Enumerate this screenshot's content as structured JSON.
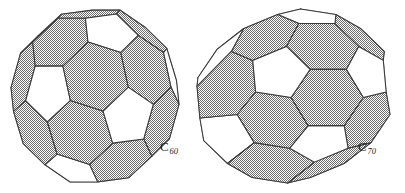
{
  "figure": {
    "name": "fullerene-structures",
    "background_color": "#ffffff",
    "line_color": "#3a3a3a",
    "shaded_face_color": "#b9b9b9",
    "white_face_color": "#ffffff",
    "caption_color": "#1a1a1a"
  },
  "molecules": [
    {
      "id": "c60",
      "element": "C",
      "atom_count": "60",
      "label_text": "C",
      "label_subscript": "60",
      "shape": "truncated-icosahedron",
      "pentagon_count": 12,
      "hexagon_count": 20,
      "vertex_count": 60,
      "edge_count": 90,
      "pentagon_fill": "white",
      "hexagon_fill": "shaded",
      "center_x": 95,
      "center_y": 96,
      "radius_x": 84,
      "radius_y": 86
    },
    {
      "id": "c70",
      "element": "C",
      "atom_count": "70",
      "label_text": "C",
      "label_subscript": "70",
      "shape": "elongated-truncated-icosahedron",
      "pentagon_count": 12,
      "hexagon_count": 25,
      "vertex_count": 70,
      "edge_count": 105,
      "pentagon_fill": "white",
      "hexagon_fill": "shaded",
      "center_x": 98,
      "center_y": 96,
      "radius_x": 97,
      "radius_y": 87
    }
  ],
  "chart_data": {
    "type": "diagram",
    "title": "",
    "items": [
      {
        "label": "C60",
        "faces_pentagon": 12,
        "faces_hexagon": 20,
        "vertices": 60
      },
      {
        "label": "C70",
        "faces_pentagon": 12,
        "faces_hexagon": 25,
        "vertices": 70
      }
    ]
  }
}
